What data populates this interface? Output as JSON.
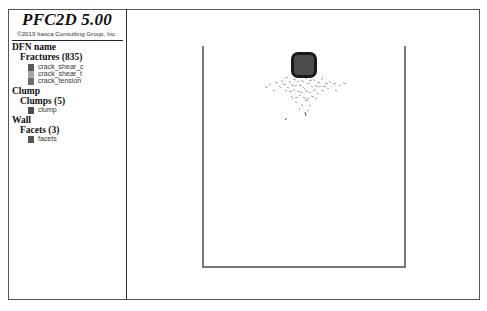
{
  "legend": {
    "title": "PFC2D 5.00",
    "copyright": "©2019 Itasca Consulting Group, Inc.",
    "groups": [
      {
        "heading": "DFN name",
        "subheading": "Fractures (835)",
        "items": [
          {
            "label": "crack_shear_c",
            "color": "#5a5a5a"
          },
          {
            "label": "crack_shear_t",
            "color": "#a8a8a8"
          },
          {
            "label": "crack_tension",
            "color": "#6e6e6e"
          }
        ]
      },
      {
        "heading": "Clump",
        "subheading": "Clumps (5)",
        "items": [
          {
            "label": "clump",
            "color": "#4d4d4d"
          }
        ]
      },
      {
        "heading": "Wall",
        "subheading": "Facets (3)",
        "items": [
          {
            "label": "facets",
            "color": "#555555"
          }
        ]
      }
    ]
  },
  "view": {
    "wall_color": "#777777",
    "clump_fill": "#4d4d4d",
    "clump_outline": "#1a1a1a",
    "crack_color": "#8c8c8c"
  }
}
